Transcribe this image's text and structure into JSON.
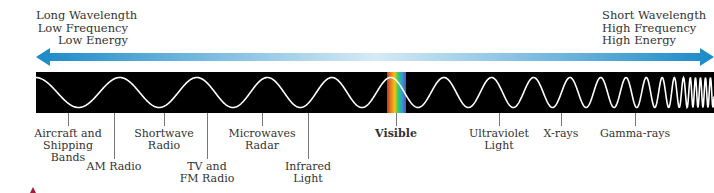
{
  "header": {
    "left": {
      "lines": [
        "Long Wavelength",
        "Low Frequency",
        "Low Energy"
      ]
    },
    "right": {
      "lines": [
        "Short Wavelength",
        "High Frequency",
        "High Energy"
      ]
    }
  },
  "arrow": {
    "direction": "bidirectional",
    "color_dark": "#1a8ac8",
    "color_light": "#cfe6f4"
  },
  "band": {
    "background": "#000000",
    "wave_color": "#ffffff",
    "visible_stripe_colors": [
      "#c0392b",
      "#e67e22",
      "#f1c40f",
      "#2ecc71",
      "#3498db",
      "#5b4db0"
    ]
  },
  "labels": [
    {
      "id": "aircraft",
      "lines": [
        "Aircraft and",
        "Shipping",
        "Bands"
      ],
      "x": 68,
      "tick_end": 117,
      "top": 128,
      "bold": false
    },
    {
      "id": "am",
      "lines": [
        "AM Radio"
      ],
      "x": 114,
      "tick_end": 158,
      "top": 161,
      "bold": false
    },
    {
      "id": "shortwave",
      "lines": [
        "Shortwave",
        "Radio"
      ],
      "x": 164,
      "tick_end": 117,
      "top": 128,
      "bold": false
    },
    {
      "id": "tvfm",
      "lines": [
        "TV and",
        "FM Radio"
      ],
      "x": 207,
      "tick_end": 158,
      "top": 161,
      "bold": false
    },
    {
      "id": "microwaves",
      "lines": [
        "Microwaves",
        "Radar"
      ],
      "x": 262,
      "tick_end": 117,
      "top": 128,
      "bold": false
    },
    {
      "id": "infrared",
      "lines": [
        "Infrared",
        "Light"
      ],
      "x": 308,
      "tick_end": 158,
      "top": 161,
      "bold": false
    },
    {
      "id": "visible",
      "lines": [
        "Visible"
      ],
      "x": 396,
      "tick_end": 117,
      "top": 128,
      "bold": true
    },
    {
      "id": "ultraviolet",
      "lines": [
        "Ultraviolet",
        "Light"
      ],
      "x": 499,
      "tick_end": 117,
      "top": 128,
      "bold": false
    },
    {
      "id": "xrays",
      "lines": [
        "X-rays"
      ],
      "x": 561,
      "tick_end": 117,
      "top": 128,
      "bold": false
    },
    {
      "id": "gamma",
      "lines": [
        "Gamma-rays"
      ],
      "x": 635,
      "tick_end": 117,
      "top": 128,
      "bold": false
    }
  ]
}
